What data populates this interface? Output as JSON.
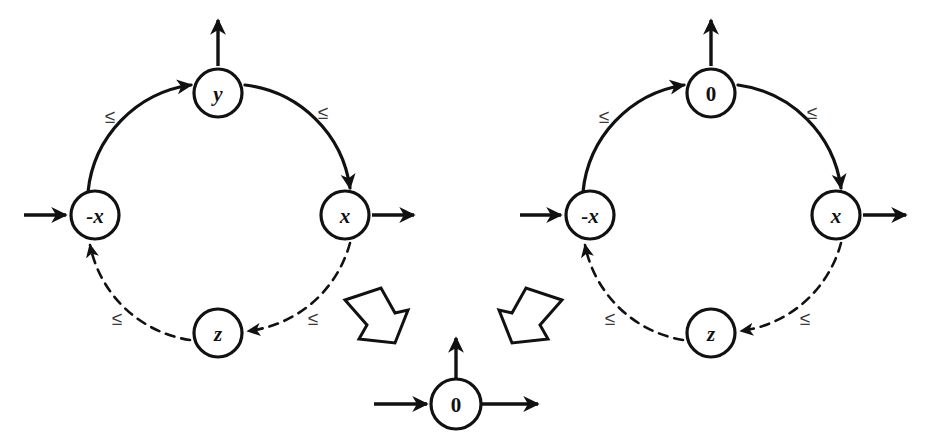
{
  "figure": {
    "background_color": "#ffffff",
    "ink_color": "#111111",
    "label_color": "#3a3a3a",
    "width": 939,
    "height": 444
  },
  "graphs": [
    {
      "id": "left-graph",
      "name": "left-constraint-graph",
      "center": {
        "x": 218,
        "y": 215
      },
      "radius": 120,
      "node_radius": 24,
      "nodes": [
        {
          "id": "left-top",
          "label": "y",
          "numeric": false,
          "x": 218,
          "y": 93,
          "position": "top"
        },
        {
          "id": "left-right",
          "label": "x",
          "numeric": false,
          "x": 345,
          "y": 215,
          "position": "right"
        },
        {
          "id": "left-bottom",
          "label": "z",
          "numeric": false,
          "x": 218,
          "y": 333,
          "position": "bottom"
        },
        {
          "id": "left-left",
          "label": "-x",
          "numeric": false,
          "x": 95,
          "y": 215,
          "position": "left"
        }
      ],
      "edges": [
        {
          "from": "left-left",
          "to": "left-top",
          "label": "≤",
          "style": "solid",
          "label_x": 110,
          "label_y": 116
        },
        {
          "from": "left-top",
          "to": "left-right",
          "label": "≤",
          "style": "solid",
          "label_x": 323,
          "label_y": 112
        },
        {
          "from": "left-right",
          "to": "left-bottom",
          "label": "≤",
          "style": "dashed",
          "label_x": 313,
          "label_y": 318
        },
        {
          "from": "left-bottom",
          "to": "left-left",
          "label": "≤",
          "style": "dashed",
          "label_x": 117,
          "label_y": 318
        }
      ],
      "io_arrows": [
        {
          "name": "incoming-arrow-left",
          "direction": "right",
          "x1": 24,
          "y1": 215,
          "x2": 68,
          "y2": 215
        },
        {
          "name": "outgoing-arrow-right",
          "direction": "right",
          "x1": 372,
          "y1": 215,
          "x2": 416,
          "y2": 215
        },
        {
          "name": "outgoing-arrow-top",
          "direction": "up",
          "x1": 218,
          "y1": 66,
          "x2": 218,
          "y2": 18
        }
      ]
    },
    {
      "id": "right-graph",
      "name": "right-constraint-graph",
      "center": {
        "x": 711,
        "y": 215
      },
      "radius": 120,
      "node_radius": 24,
      "nodes": [
        {
          "id": "right-top",
          "label": "0",
          "numeric": true,
          "x": 711,
          "y": 93,
          "position": "top"
        },
        {
          "id": "right-right",
          "label": "x",
          "numeric": false,
          "x": 836,
          "y": 215,
          "position": "right"
        },
        {
          "id": "right-bottom",
          "label": "z",
          "numeric": false,
          "x": 711,
          "y": 333,
          "position": "bottom"
        },
        {
          "id": "right-left",
          "label": "-x",
          "numeric": false,
          "x": 590,
          "y": 215,
          "position": "left"
        }
      ],
      "edges": [
        {
          "from": "right-left",
          "to": "right-top",
          "label": "≤",
          "style": "solid",
          "label_x": 604,
          "label_y": 116
        },
        {
          "from": "right-top",
          "to": "right-right",
          "label": "≤",
          "style": "solid",
          "label_x": 812,
          "label_y": 112
        },
        {
          "from": "right-right",
          "to": "right-bottom",
          "label": "≤",
          "style": "dashed",
          "label_x": 805,
          "label_y": 318
        },
        {
          "from": "right-bottom",
          "to": "right-left",
          "label": "≤",
          "style": "dashed",
          "label_x": 610,
          "label_y": 318
        }
      ],
      "io_arrows": [
        {
          "name": "incoming-arrow-left",
          "direction": "right",
          "x1": 520,
          "y1": 215,
          "x2": 563,
          "y2": 215
        },
        {
          "name": "outgoing-arrow-right",
          "direction": "right",
          "x1": 863,
          "y1": 215,
          "x2": 908,
          "y2": 215
        },
        {
          "name": "outgoing-arrow-top",
          "direction": "up",
          "x1": 711,
          "y1": 66,
          "x2": 711,
          "y2": 18
        }
      ]
    }
  ],
  "result_node": {
    "id": "result-zero-node",
    "name": "result-zero-node",
    "label": "0",
    "numeric": true,
    "x": 456,
    "y": 404,
    "radius": 25,
    "io_arrows": [
      {
        "name": "incoming-arrow-left",
        "direction": "right",
        "x1": 374,
        "y1": 404,
        "x2": 426,
        "y2": 404
      },
      {
        "name": "outgoing-arrow-right",
        "direction": "right",
        "x1": 486,
        "y1": 404,
        "x2": 538,
        "y2": 404
      },
      {
        "name": "outgoing-arrow-top",
        "direction": "up",
        "x1": 456,
        "y1": 376,
        "x2": 456,
        "y2": 336
      }
    ]
  },
  "reduction_arrows": [
    {
      "id": "left-reduction-arrow",
      "name": "left-block-arrow",
      "points": "345,300 381,288 395,313 408,310 395,343 359,339 367,325",
      "direction": "down-right"
    },
    {
      "id": "right-reduction-arrow",
      "name": "right-block-arrow",
      "points": "562,300 526,288 512,313 499,310 512,343 548,339 540,325",
      "direction": "down-left"
    }
  ]
}
